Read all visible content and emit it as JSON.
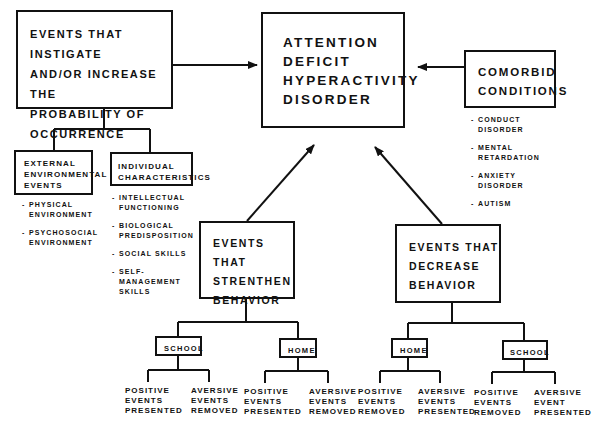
{
  "main": {
    "lines": [
      "ATTENTION",
      "DEFICIT",
      "HYPERACTIVITY",
      "DISORDER"
    ]
  },
  "instigating": {
    "lines": [
      "EVENTS THAT INSTIGATE",
      "AND/OR INCREASE THE",
      "PROBABILITY OF",
      "OCCURRENCE"
    ],
    "children": {
      "external": {
        "lines": [
          "EXTERNAL",
          "ENVIRONMENTAL",
          "EVENTS"
        ],
        "items": [
          {
            "l1": "PHYSICAL",
            "l2": "ENVIRONMENT"
          },
          {
            "l1": "PSYCHOSOCIAL",
            "l2": "ENVIRONMENT"
          }
        ]
      },
      "individual": {
        "lines": [
          "INDIVIDUAL",
          "CHARACTERISTICS"
        ],
        "items": [
          {
            "l1": "INTELLECTUAL",
            "l2": "FUNCTIONING"
          },
          {
            "l1": "BIOLOGICAL",
            "l2": "PREDISPOSITION"
          },
          {
            "l1": "SOCIAL SKILLS",
            "l2": ""
          },
          {
            "l1": "SELF-",
            "l2": "MANAGEMENT",
            "l3": "SKILLS"
          }
        ]
      }
    }
  },
  "comorbid": {
    "lines": [
      "COMORBID",
      "CONDITIONS"
    ],
    "items": [
      {
        "l1": "CONDUCT",
        "l2": "DISORDER"
      },
      {
        "l1": "MENTAL",
        "l2": "RETARDATION"
      },
      {
        "l1": "ANXIETY",
        "l2": "DISORDER"
      },
      {
        "l1": "AUTISM",
        "l2": ""
      }
    ]
  },
  "strengthen": {
    "lines": [
      "EVENTS THAT",
      "STRENTHEN",
      "BEHAVIOR"
    ],
    "settings": [
      {
        "label": "SCHOOL",
        "leaves": [
          [
            "POSITIVE",
            "EVENTS",
            "PRESENTED"
          ],
          [
            "AVERSIVE",
            "EVENTS",
            "REMOVED"
          ]
        ]
      },
      {
        "label": "HOME",
        "leaves": [
          [
            "POSITIVE",
            "EVENTS",
            "PRESENTED"
          ],
          [
            "AVERSIVE",
            "EVENTS",
            "REMOVED"
          ]
        ]
      }
    ]
  },
  "decrease": {
    "lines": [
      "EVENTS THAT",
      "DECREASE",
      "BEHAVIOR"
    ],
    "settings": [
      {
        "label": "HOME",
        "leaves": [
          [
            "POSITIVE",
            "EVENTS",
            "REMOVED"
          ],
          [
            "AVERSIVE",
            "EVENTS",
            "PRESENTED"
          ]
        ]
      },
      {
        "label": "SCHOOL",
        "leaves": [
          [
            "POSITIVE",
            "EVENTS",
            "REMOVED"
          ],
          [
            "AVERSIVE",
            "EVENT",
            "PRESENTED"
          ]
        ]
      }
    ]
  },
  "colors": {
    "ink": "#111111",
    "paper": "#ffffff"
  }
}
